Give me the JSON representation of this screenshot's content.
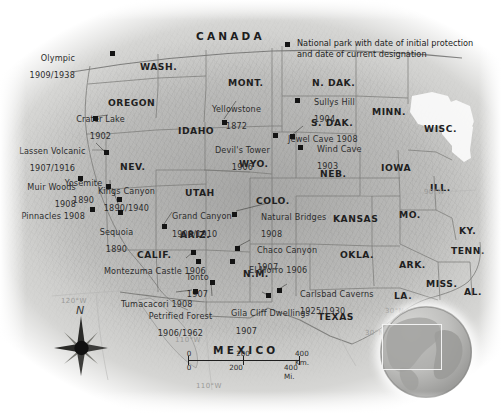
{
  "map": {
    "title": "National parks of the western United States",
    "legend": {
      "marker_name": "national-park-marker",
      "text": "National park with date of initial protection\nand date of current designation"
    },
    "countries": [
      {
        "name": "CANADA",
        "x": 196,
        "y": 31
      },
      {
        "name": "MEXICO",
        "x": 213,
        "y": 345
      }
    ],
    "states": [
      {
        "name": "WASH.",
        "x": 140,
        "y": 62
      },
      {
        "name": "OREGON",
        "x": 108,
        "y": 98
      },
      {
        "name": "IDAHO",
        "x": 178,
        "y": 126
      },
      {
        "name": "MONT.",
        "x": 228,
        "y": 78
      },
      {
        "name": "N. DAK.",
        "x": 312,
        "y": 78
      },
      {
        "name": "S. DAK.",
        "x": 311,
        "y": 118
      },
      {
        "name": "MINN.",
        "x": 372,
        "y": 107
      },
      {
        "name": "WISC.",
        "x": 424,
        "y": 124
      },
      {
        "name": "NEV.",
        "x": 120,
        "y": 162
      },
      {
        "name": "WYO.",
        "x": 239,
        "y": 159
      },
      {
        "name": "NEB.",
        "x": 320,
        "y": 169
      },
      {
        "name": "IOWA",
        "x": 381,
        "y": 163
      },
      {
        "name": "ILL.",
        "x": 430,
        "y": 183
      },
      {
        "name": "UTAH",
        "x": 185,
        "y": 188
      },
      {
        "name": "COLO.",
        "x": 256,
        "y": 196
      },
      {
        "name": "KANSAS",
        "x": 333,
        "y": 214
      },
      {
        "name": "MO.",
        "x": 399,
        "y": 210
      },
      {
        "name": "KY.",
        "x": 459,
        "y": 226
      },
      {
        "name": "CALIF.",
        "x": 137,
        "y": 250
      },
      {
        "name": "ARIZ.",
        "x": 180,
        "y": 230
      },
      {
        "name": "N.M.",
        "x": 243,
        "y": 269
      },
      {
        "name": "OKLA.",
        "x": 340,
        "y": 250
      },
      {
        "name": "ARK.",
        "x": 399,
        "y": 260
      },
      {
        "name": "TENN.",
        "x": 451,
        "y": 246
      },
      {
        "name": "MISS.",
        "x": 426,
        "y": 279
      },
      {
        "name": "AL.",
        "x": 464,
        "y": 287
      },
      {
        "name": "LA.",
        "x": 394,
        "y": 291
      },
      {
        "name": "TEXAS",
        "x": 318,
        "y": 312
      }
    ],
    "parks": [
      {
        "name": "Olympic",
        "dates": "1909/1938",
        "label_x": 75,
        "label_y": 45,
        "align": "r",
        "marker_x": 110,
        "marker_y": 51
      },
      {
        "name": "Crater Lake",
        "dates": "1902",
        "label_x": 95,
        "label_y": 106,
        "align": "c",
        "marker_x": 93,
        "marker_y": 116
      },
      {
        "name": "Lassen Volcanic",
        "dates": "1907/1916",
        "label_x": 47,
        "label_y": 138,
        "align": "r",
        "marker_x": 104,
        "marker_y": 150
      },
      {
        "name": "Yosemite",
        "dates": "1890",
        "label_x": 78,
        "label_y": 170,
        "align": "c",
        "marker_x": 106,
        "marker_y": 184
      },
      {
        "name": "Muir Woods",
        "dates": "1908",
        "label_x": 37,
        "label_y": 174,
        "align": "r",
        "marker_x": 78,
        "marker_y": 176
      },
      {
        "name": "Kings Canyon",
        "dates": "1890/1940",
        "label_x": 120,
        "label_y": 178,
        "align": "c",
        "marker_x": 117,
        "marker_y": 207
      },
      {
        "name": "Pinnacles 1908",
        "dates": "",
        "label_x": 33,
        "label_y": 203,
        "align": "r",
        "marker_x": 90,
        "marker_y": 207
      },
      {
        "name": "Sequoia",
        "dates": "1890",
        "label_x": 110,
        "label_y": 219,
        "align": "c",
        "marker_x": 117,
        "marker_y": 207
      },
      {
        "name": "Yellowstone",
        "dates": "1872",
        "label_x": 229,
        "label_y": 96,
        "align": "c",
        "marker_x": 222,
        "marker_y": 120
      },
      {
        "name": "Devil's Tower",
        "dates": "1906",
        "label_x": 237,
        "label_y": 137,
        "align": "c",
        "marker_x": 273,
        "marker_y": 133
      },
      {
        "name": "Sullys Hill",
        "dates": "1904",
        "label_x": 303,
        "label_y": 89,
        "align": "c",
        "marker_x": 295,
        "marker_y": 98
      },
      {
        "name": "Jewel Cave 1908",
        "dates": "",
        "label_x": 290,
        "label_y": 126,
        "align": "c",
        "marker_x": 290,
        "marker_y": 134
      },
      {
        "name": "Wind Cave",
        "dates": "1903",
        "label_x": 306,
        "label_y": 136,
        "align": "c",
        "marker_x": 298,
        "marker_y": 145
      },
      {
        "name": "Grand Canyon",
        "dates": "1908/1910",
        "label_x": 166,
        "label_y": 203,
        "align": "c",
        "marker_x": 162,
        "marker_y": 224
      },
      {
        "name": "Natural Bridges",
        "dates": "1908",
        "label_x": 272,
        "label_y": 204,
        "align": "c",
        "marker_x": 232,
        "marker_y": 212
      },
      {
        "name": "Chaco Canyon",
        "dates": "1907",
        "label_x": 255,
        "label_y": 237,
        "align": "c",
        "marker_x": 235,
        "marker_y": 246
      },
      {
        "name": "El Morro 1906",
        "dates": "",
        "label_x": 263,
        "label_y": 257,
        "align": "c",
        "marker_x": 230,
        "marker_y": 259
      },
      {
        "name": "Montezuma Castle 1906",
        "dates": "",
        "label_x": 93,
        "label_y": 258,
        "align": "l",
        "marker_x": 191,
        "marker_y": 250
      },
      {
        "name": "Tonto",
        "dates": "1907",
        "label_x": 181,
        "label_y": 264,
        "align": "c",
        "marker_x": 196,
        "marker_y": 259
      },
      {
        "name": "Tumacacori 1908",
        "dates": "",
        "label_x": 110,
        "label_y": 291,
        "align": "l",
        "marker_x": 193,
        "marker_y": 289
      },
      {
        "name": "Petrified Forest",
        "dates": "1906/1962",
        "label_x": 172,
        "label_y": 303,
        "align": "c",
        "marker_x": 210,
        "marker_y": 280
      },
      {
        "name": "Gila Cliff Dwellings",
        "dates": "1907",
        "label_x": 240,
        "label_y": 300,
        "align": "c",
        "marker_x": 266,
        "marker_y": 293
      },
      {
        "name": "Carlsbad Caverns",
        "dates": "1925/1930",
        "label_x": 289,
        "label_y": 281,
        "align": "l",
        "marker_x": 277,
        "marker_y": 288
      }
    ],
    "graticule_labels": [
      {
        "text": "120°W",
        "x": 61,
        "y": 298
      },
      {
        "text": "110°W",
        "x": 175,
        "y": 337
      },
      {
        "text": "30°N",
        "x": 385,
        "y": 308
      },
      {
        "text": "30°N",
        "x": 365,
        "y": 330
      },
      {
        "text": "110°W",
        "x": 196,
        "y": 383
      },
      {
        "text": "90°W",
        "x": 424,
        "y": 189
      }
    ],
    "scale_bar": {
      "km_labels": [
        "0",
        "200",
        "400 Km."
      ],
      "mi_labels": [
        "0",
        "200",
        "400 Mi."
      ]
    },
    "compass": {
      "north_letter": "N"
    },
    "inset": {
      "name": "globe-locator-inset"
    }
  }
}
